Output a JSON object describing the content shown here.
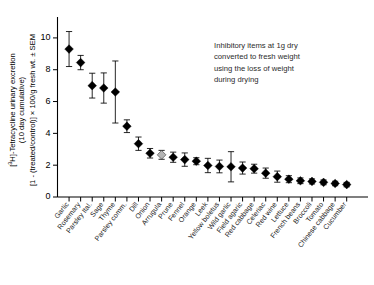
{
  "figure": {
    "annotation": {
      "lines": [
        "Inhibitory items at 1g dry",
        "converted to fresh weight",
        "using the loss of weight",
        "during drying"
      ]
    },
    "ylabel": {
      "line1_pre": "[",
      "line1_sup": "3",
      "line1_post": "H]-Tetracycline urinary excretion",
      "line2": "(10 day cumulative)",
      "line3": "[1 - (treated/control)] × 100/g fresh wt. ± SEM"
    },
    "colors": {
      "marker_black": "#000000",
      "marker_gray": "#b4b4b4",
      "marker_gray_edge": "#4d4d4d",
      "axis": "#000000",
      "annotation_text": "#2b2b2b"
    }
  },
  "chart_data": {
    "type": "scatter",
    "title": "",
    "xlabel": "",
    "ylabel": "[3H]-Tetracycline urinary excretion (10 day cumulative) [1 - (treated/control)] × 100/g fresh wt. ± SEM",
    "ylim": [
      0,
      11
    ],
    "yticks": [
      0,
      2,
      4,
      6,
      8,
      10
    ],
    "ytick_labels": [
      "0",
      "2",
      "4",
      "6",
      "8",
      "10"
    ],
    "grid": false,
    "legend": "none",
    "error_type": "SEM",
    "categories": [
      "Garlic",
      "Rosemary",
      "Parsley Ital.",
      "Sage",
      "Thyme",
      "Parsley comm.",
      "Dill",
      "Onion",
      "Arrugula",
      "Prune",
      "Fennel",
      "Orange",
      "Leek",
      "Yellow boletus",
      "Wild garlic",
      "Field agaric",
      "Red cabbage",
      "Celeriac",
      "Red wine",
      "Lettuce",
      "French beans",
      "Broccoli",
      "Tomato",
      "Chinese cabbage",
      "Cucumber"
    ],
    "values": [
      9.3,
      8.45,
      7.0,
      6.85,
      6.6,
      4.45,
      3.35,
      2.75,
      2.65,
      2.5,
      2.35,
      2.25,
      1.98,
      1.92,
      1.9,
      1.82,
      1.78,
      1.5,
      1.28,
      1.12,
      1.02,
      0.98,
      0.92,
      0.85,
      0.78
    ],
    "errors": [
      1.1,
      0.45,
      0.78,
      0.95,
      1.95,
      0.4,
      0.42,
      0.3,
      0.28,
      0.32,
      0.42,
      0.22,
      0.45,
      0.4,
      0.95,
      0.38,
      0.28,
      0.32,
      0.35,
      0.22,
      0.18,
      0.16,
      0.15,
      0.14,
      0.14
    ],
    "marker_colors": [
      "black",
      "black",
      "black",
      "black",
      "black",
      "black",
      "black",
      "black",
      "gray",
      "black",
      "black",
      "black",
      "black",
      "black",
      "black",
      "black",
      "black",
      "black",
      "black",
      "black",
      "black",
      "black",
      "black",
      "black",
      "black"
    ]
  }
}
